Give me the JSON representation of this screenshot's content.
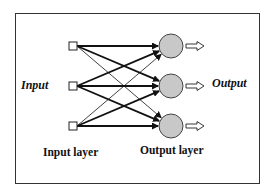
{
  "labels": {
    "input": "Input",
    "output": "Output",
    "input_layer": "Input layer",
    "output_layer": "Output layer"
  },
  "colors": {
    "border": "#333333",
    "line": "#111111",
    "neuron_fill": "#c8c8c8",
    "neuron_stroke": "#444444"
  },
  "diagram": {
    "input_nodes": [
      {
        "id": "i1",
        "shape": "square",
        "x": 73,
        "y": 46
      },
      {
        "id": "i2",
        "shape": "square",
        "x": 73,
        "y": 86
      },
      {
        "id": "i3",
        "shape": "square",
        "x": 73,
        "y": 126
      }
    ],
    "output_nodes": [
      {
        "id": "o1",
        "shape": "circle",
        "x": 171,
        "y": 46,
        "r": 12
      },
      {
        "id": "o2",
        "shape": "circle",
        "x": 171,
        "y": 86,
        "r": 12
      },
      {
        "id": "o3",
        "shape": "circle",
        "x": 171,
        "y": 126,
        "r": 12
      }
    ],
    "connections": [
      {
        "from": "i1",
        "to": "o1",
        "weight": "thick"
      },
      {
        "from": "i1",
        "to": "o2",
        "weight": "thick"
      },
      {
        "from": "i1",
        "to": "o3",
        "weight": "thin"
      },
      {
        "from": "i2",
        "to": "o1",
        "weight": "thick"
      },
      {
        "from": "i2",
        "to": "o2",
        "weight": "thick"
      },
      {
        "from": "i2",
        "to": "o3",
        "weight": "thick"
      },
      {
        "from": "i3",
        "to": "o1",
        "weight": "thin"
      },
      {
        "from": "i3",
        "to": "o2",
        "weight": "thick"
      },
      {
        "from": "i3",
        "to": "o3",
        "weight": "thick"
      }
    ],
    "output_arrows": [
      "hollow-right-arrow",
      "hollow-right-arrow",
      "hollow-right-arrow"
    ]
  }
}
